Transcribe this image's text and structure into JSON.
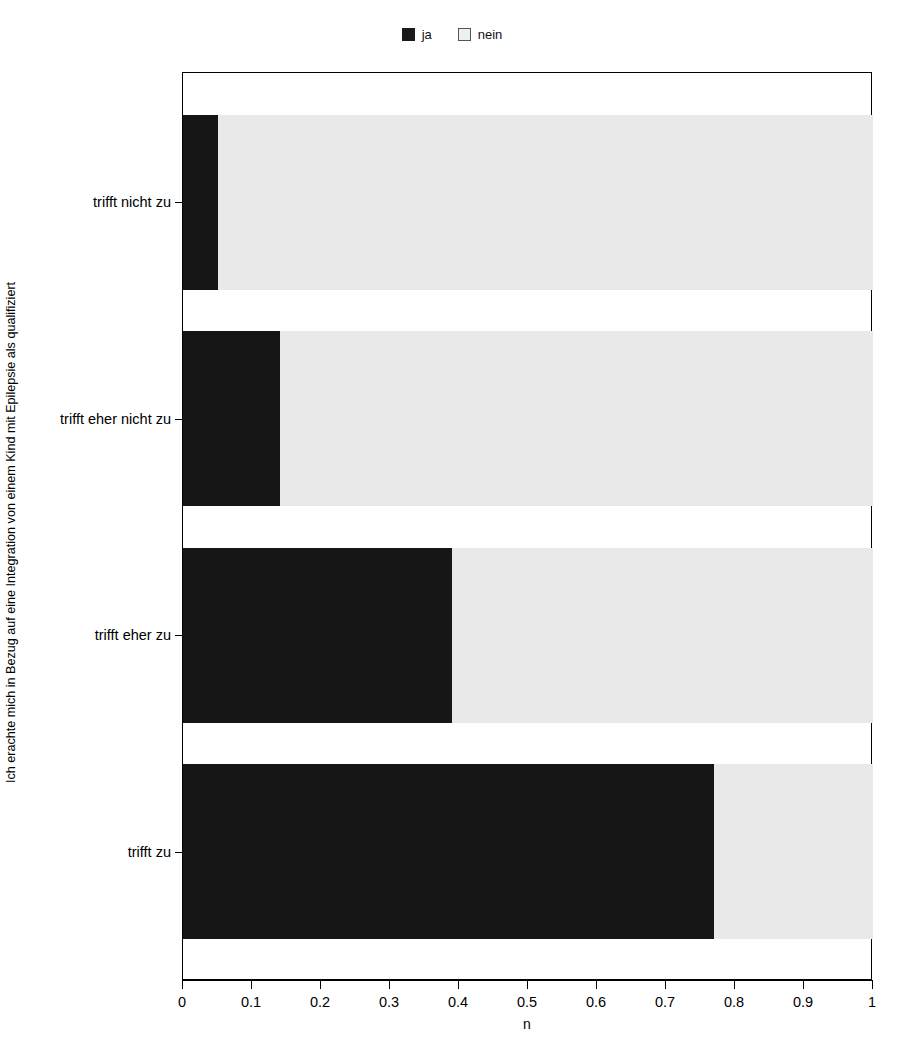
{
  "legend": {
    "position": "top-center",
    "entries": [
      {
        "label": "ja",
        "color": "#161616",
        "swatch": "filled-square-icon"
      },
      {
        "label": "nein",
        "color": "#e9e9e9",
        "swatch": "outlined-square-icon"
      }
    ]
  },
  "axes": {
    "y_title": "Ich erachte mich in Bezug auf eine Integration von einem Kind mit Epilepsie als qualifiziert",
    "x_title": "n",
    "x_ticklabels": [
      "0",
      "0.1",
      "0.2",
      "0.3",
      "0.4",
      "0.5",
      "0.6",
      "0.7",
      "0.8",
      "0.9",
      "1"
    ],
    "y_ticklabels": [
      "trifft nicht zu",
      "trifft eher nicht zu",
      "trifft eher zu",
      "trifft zu"
    ]
  },
  "chart_data": {
    "type": "bar",
    "orientation": "horizontal",
    "stacked": true,
    "normalized": true,
    "title": "",
    "subtitle": "",
    "xlabel": "n",
    "ylabel": "Ich erachte mich in Bezug auf eine Integration von einem Kind mit Epilepsie als qualifiziert",
    "xlim": [
      0,
      1
    ],
    "xticks": [
      0,
      0.1,
      0.2,
      0.3,
      0.4,
      0.5,
      0.6,
      0.7,
      0.8,
      0.9,
      1
    ],
    "grid": false,
    "legend": [
      "ja",
      "nein"
    ],
    "legend_position": "top-center",
    "categories": [
      "trifft nicht zu",
      "trifft eher nicht zu",
      "trifft eher zu",
      "trifft zu"
    ],
    "series": [
      {
        "name": "ja",
        "color": "#161616",
        "values": [
          0.05,
          0.14,
          0.39,
          0.77
        ]
      },
      {
        "name": "nein",
        "color": "#e9e9e9",
        "values": [
          0.95,
          0.86,
          0.61,
          0.23
        ]
      }
    ]
  }
}
